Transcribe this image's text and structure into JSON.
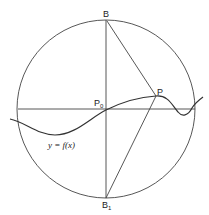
{
  "diagram": {
    "labels": {
      "B": "B",
      "B1_main": "B",
      "B1_sub": "1",
      "P0_main": "P",
      "P0_sub": "0",
      "P": "P",
      "curve": "y = f(x)"
    },
    "colors": {
      "stroke": "#333333",
      "background": "#ffffff"
    }
  }
}
